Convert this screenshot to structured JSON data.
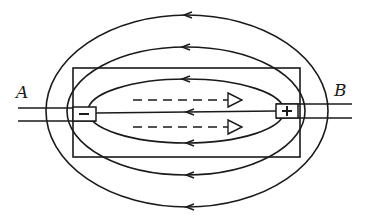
{
  "figure": {
    "type": "electric field lines around a battery/electrolytic cell",
    "labels": {
      "left_terminal": "A",
      "right_terminal": "B",
      "negative_electrode": "−",
      "positive_electrode": "+"
    },
    "field_lines": [
      {
        "name": "outer",
        "cx": 187,
        "cy": 111,
        "rx": 141,
        "ry": 96
      },
      {
        "name": "middle",
        "cx": 186,
        "cy": 111,
        "rx": 119,
        "ry": 64
      },
      {
        "name": "inner",
        "cx": 186,
        "cy": 111,
        "rx": 98,
        "ry": 32
      }
    ],
    "arrow_direction": "right-to-left (from + to −) on every field line",
    "dashed_arrows": {
      "count": 2,
      "direction": "left-to-right",
      "style": "dashed with open triangular head"
    },
    "colors": {
      "ink": "#1a1a1a",
      "background": "#ffffff"
    }
  }
}
